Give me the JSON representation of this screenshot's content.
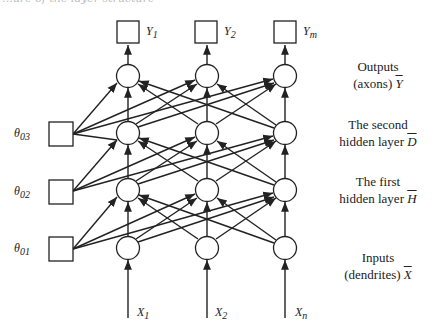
{
  "header": {
    "cropped_caption": "…ure of the layer structure"
  },
  "outputs": [
    {
      "label": "Y",
      "sub": "1"
    },
    {
      "label": "Y",
      "sub": "2"
    },
    {
      "label": "Y",
      "sub": "m"
    }
  ],
  "inputs": [
    {
      "label": "X",
      "sub": "1"
    },
    {
      "label": "X",
      "sub": "2"
    },
    {
      "label": "X",
      "sub": "n"
    }
  ],
  "biases": [
    {
      "label": "θ",
      "sub": "03"
    },
    {
      "label": "θ",
      "sub": "02"
    },
    {
      "label": "θ",
      "sub": "01"
    }
  ],
  "layer_labels": {
    "outputs": {
      "line1": "Outputs",
      "line2": "(axons)",
      "symbol": "Y"
    },
    "hidden2": {
      "line1": "The second",
      "line2": "hidden layer",
      "symbol": "D"
    },
    "hidden1": {
      "line1": "The first",
      "line2": "hidden layer",
      "symbol": "H"
    },
    "inputs": {
      "line1": "Inputs",
      "line2": "(dendrites)",
      "symbol": "X"
    }
  },
  "colors": {
    "stroke": "#222222",
    "background": "#ffffff"
  }
}
